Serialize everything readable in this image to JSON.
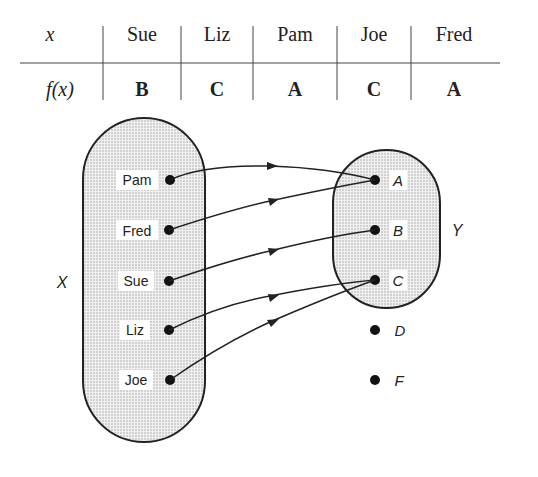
{
  "table": {
    "row_header_x": "x",
    "row_header_fx": "f(x)",
    "columns": [
      {
        "x": "Sue",
        "fx": "B"
      },
      {
        "x": "Liz",
        "fx": "C"
      },
      {
        "x": "Pam",
        "fx": "A"
      },
      {
        "x": "Joe",
        "fx": "C"
      },
      {
        "x": "Fred",
        "fx": "A"
      }
    ]
  },
  "diagram": {
    "domain_label": "X",
    "codomain_label": "Y",
    "domain_elements": [
      "Pam",
      "Fred",
      "Sue",
      "Liz",
      "Joe"
    ],
    "codomain_elements_inside": [
      "A",
      "B",
      "C"
    ],
    "outside_elements": [
      "D",
      "F"
    ],
    "mappings": [
      {
        "from": "Pam",
        "to": "A"
      },
      {
        "from": "Fred",
        "to": "A"
      },
      {
        "from": "Sue",
        "to": "B"
      },
      {
        "from": "Liz",
        "to": "C"
      },
      {
        "from": "Joe",
        "to": "C"
      }
    ]
  }
}
